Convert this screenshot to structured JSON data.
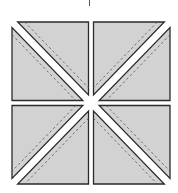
{
  "diagram": {
    "title": "",
    "colors": {
      "background": "#ffffff",
      "fabric_fill": "#d2d2d2",
      "outline": "#2a2a2a",
      "seam": "#555555"
    },
    "outer_bounds": {
      "x0": 12,
      "y0": 22,
      "x1": 170,
      "y1": 184
    },
    "gap": 5,
    "strip_half_width": 4,
    "seam_offset": 5,
    "quarters": [
      {
        "id": "top-left",
        "diagonal": "backslash"
      },
      {
        "id": "top-right",
        "diagonal": "slash"
      },
      {
        "id": "bottom-left",
        "diagonal": "slash"
      },
      {
        "id": "bottom-right",
        "diagonal": "backslash"
      }
    ],
    "top_tick": {
      "x": 89,
      "y0": 0,
      "y1": 6
    }
  }
}
